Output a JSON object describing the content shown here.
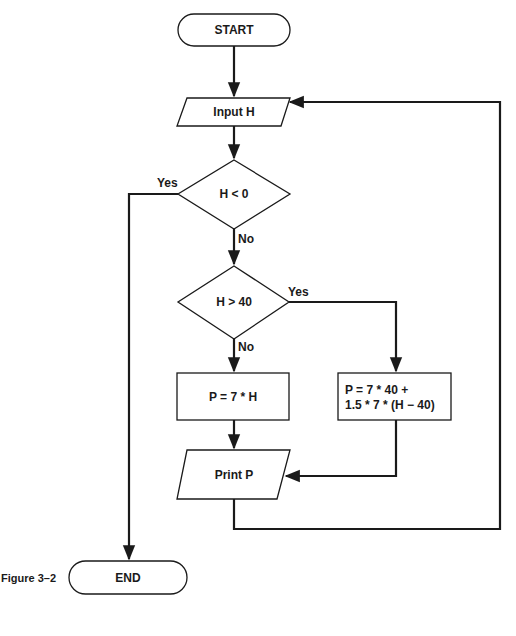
{
  "caption": "Figure 3–2",
  "nodes": {
    "start": {
      "type": "terminal",
      "label": "START"
    },
    "input": {
      "type": "io",
      "label": "Input H"
    },
    "decision1": {
      "type": "decision",
      "label": "H < 0",
      "yes": "Yes",
      "no": "No"
    },
    "decision2": {
      "type": "decision",
      "label": "H > 40",
      "yes": "Yes",
      "no": "No"
    },
    "process_regular": {
      "type": "process",
      "label": "P = 7 * H"
    },
    "process_overtime": {
      "type": "process",
      "line1": "P = 7 * 40 +",
      "line2": "1.5 * 7 * (H − 40)"
    },
    "print": {
      "type": "io",
      "label": "Print P"
    },
    "end": {
      "type": "terminal",
      "label": "END"
    }
  },
  "edges": [
    {
      "from": "start",
      "to": "input"
    },
    {
      "from": "input",
      "to": "decision1"
    },
    {
      "from": "decision1",
      "to": "end",
      "label": "Yes"
    },
    {
      "from": "decision1",
      "to": "decision2",
      "label": "No"
    },
    {
      "from": "decision2",
      "to": "process_overtime",
      "label": "Yes"
    },
    {
      "from": "decision2",
      "to": "process_regular",
      "label": "No"
    },
    {
      "from": "process_regular",
      "to": "print"
    },
    {
      "from": "process_overtime",
      "to": "print"
    },
    {
      "from": "print",
      "to": "input"
    }
  ],
  "colors": {
    "stroke": "#1a1a1a",
    "background": "#ffffff"
  }
}
